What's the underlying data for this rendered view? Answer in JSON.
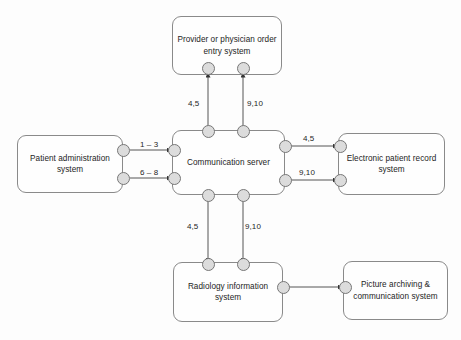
{
  "diagram": {
    "background_color": "#fdfdfd",
    "node_fill": "#fefefe",
    "node_border": "#8a8a8a",
    "port_fill": "#dcdcdc",
    "port_border": "#777777",
    "line_color": "#555555",
    "text_color": "#1d1d1d"
  },
  "nodes": {
    "provider_order_entry": {
      "label": "Provider or physician order\nentry system"
    },
    "patient_administration": {
      "label": "Patient administration\nsystem"
    },
    "communication_server": {
      "label": "Communication server"
    },
    "electronic_patient_record": {
      "label": "Electronic patient record\nsystem"
    },
    "radiology_information": {
      "label": "Radiology information\nsystem"
    },
    "picture_archiving": {
      "label": "Picture archiving &\ncommunication system"
    }
  },
  "edge_labels": {
    "pas_to_cs_upper": "1 – 3",
    "pas_to_cs_lower": "6 – 8",
    "cs_to_poe_left": "4,5",
    "cs_to_poe_right": "9,10",
    "cs_to_epr_upper": "4,5",
    "cs_to_epr_lower": "9,10",
    "cs_to_ris_left": "4,5",
    "cs_to_ris_right": "9,10"
  }
}
